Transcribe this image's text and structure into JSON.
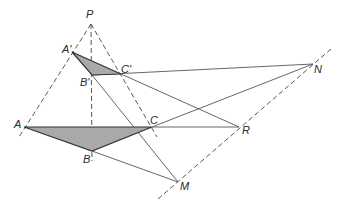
{
  "diagram": {
    "colors": {
      "fill": "#a9a9a9",
      "stroke": "#333333",
      "line": "#555555"
    },
    "points": {
      "P": {
        "label": "P",
        "x": 91,
        "y": 24
      },
      "A1": {
        "label": "A'",
        "x": 72,
        "y": 52
      },
      "B1": {
        "label": "B'",
        "x": 92,
        "y": 75
      },
      "C1": {
        "label": "C'",
        "x": 121,
        "y": 74
      },
      "A": {
        "label": "A",
        "x": 24,
        "y": 127
      },
      "B": {
        "label": "B",
        "x": 92,
        "y": 151
      },
      "C": {
        "label": "C",
        "x": 152,
        "y": 127
      },
      "N": {
        "label": "N",
        "x": 313,
        "y": 64
      },
      "R": {
        "label": "R",
        "x": 239,
        "y": 127
      },
      "M": {
        "label": "M",
        "x": 178,
        "y": 182
      }
    },
    "triangles": [
      {
        "name": "A'B'C'",
        "vertices": [
          "A1",
          "B1",
          "C1"
        ],
        "shaded": true
      },
      {
        "name": "ABC",
        "vertices": [
          "A",
          "B",
          "C"
        ],
        "shaded": true
      }
    ],
    "dashed_lines": [
      {
        "from": "P",
        "to": "A",
        "desc": "PA through A'"
      },
      {
        "from": "P",
        "to": "B",
        "desc": "PB through B'"
      },
      {
        "from": "P",
        "to": "C",
        "desc": "PC through C'"
      },
      {
        "from": "M",
        "to": "N",
        "desc": "axis of perspectivity through M, R, N"
      }
    ],
    "solid_lines": [
      {
        "from": "B1",
        "to": "N"
      },
      {
        "from": "C",
        "to": "N"
      },
      {
        "from": "C1",
        "to": "R"
      },
      {
        "from": "C",
        "to": "R"
      },
      {
        "from": "B1",
        "to": "M"
      },
      {
        "from": "B",
        "to": "M"
      }
    ]
  }
}
